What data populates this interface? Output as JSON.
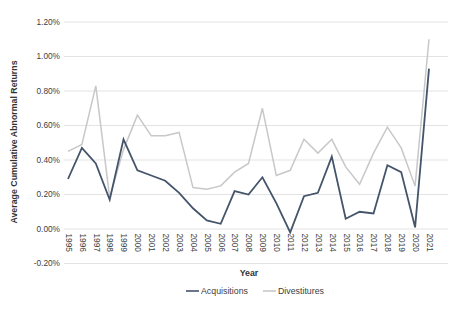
{
  "chart_data": {
    "type": "line",
    "title": "",
    "xlabel": "Year",
    "ylabel": "Average Cumulative Abnormal Returns",
    "units": "percent",
    "grid": true,
    "legend_position": "bottom",
    "ylim": [
      -0.2,
      1.2
    ],
    "yticks": [
      {
        "value": -0.2,
        "label": "-0.20%"
      },
      {
        "value": 0.0,
        "label": "0.00%"
      },
      {
        "value": 0.2,
        "label": "0.20%"
      },
      {
        "value": 0.4,
        "label": "0.40%"
      },
      {
        "value": 0.6,
        "label": "0.60%"
      },
      {
        "value": 0.8,
        "label": "0.80%"
      },
      {
        "value": 1.0,
        "label": "1.00%"
      },
      {
        "value": 1.2,
        "label": "1.20%"
      }
    ],
    "x": [
      "1995",
      "1996",
      "1997",
      "1998",
      "1999",
      "2000",
      "2001",
      "2002",
      "2003",
      "2004",
      "2005",
      "2006",
      "2007",
      "2008",
      "2009",
      "2010",
      "2011",
      "2012",
      "2013",
      "2014",
      "2015",
      "2016",
      "2017",
      "2018",
      "2019",
      "2020",
      "2021"
    ],
    "series": [
      {
        "name": "Acquisitions",
        "color": "#44546a",
        "values": [
          0.29,
          0.47,
          0.38,
          0.17,
          0.52,
          0.34,
          0.31,
          0.28,
          0.21,
          0.12,
          0.05,
          0.03,
          0.22,
          0.2,
          0.3,
          0.15,
          -0.02,
          0.19,
          0.21,
          0.42,
          0.06,
          0.1,
          0.09,
          0.37,
          0.33,
          0.01,
          0.93
        ]
      },
      {
        "name": "Divestitures",
        "color": "#c8c8c8",
        "values": [
          0.45,
          0.49,
          0.83,
          0.18,
          0.46,
          0.66,
          0.54,
          0.54,
          0.56,
          0.24,
          0.23,
          0.25,
          0.33,
          0.38,
          0.7,
          0.31,
          0.34,
          0.52,
          0.44,
          0.52,
          0.36,
          0.26,
          0.44,
          0.59,
          0.47,
          0.25,
          1.1
        ]
      }
    ]
  },
  "styles": {
    "background": "#ffffff",
    "grid_color": "#e3e3e3",
    "tick_text_color": "#404040",
    "axis_title_color": "#333333",
    "acquisitions_line_color": "#44546a",
    "divestitures_line_color": "#c8c8c8"
  }
}
